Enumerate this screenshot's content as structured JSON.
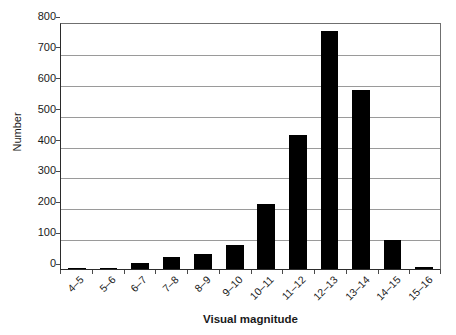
{
  "chart_data": {
    "type": "bar",
    "title": "",
    "xlabel": "Visual magnitude",
    "ylabel": "Number",
    "categories": [
      "4–5",
      "5–6",
      "6–7",
      "7–8",
      "8–9",
      "9–10",
      "10–11",
      "11–12",
      "12–13",
      "13–14",
      "14–15",
      "15–16"
    ],
    "values": [
      3,
      4,
      20,
      38,
      50,
      78,
      210,
      435,
      770,
      580,
      95,
      5
    ],
    "ylim": [
      0,
      800
    ],
    "yticks": [
      0,
      100,
      200,
      300,
      400,
      500,
      600,
      700,
      800
    ],
    "ytick_labels": [
      "0",
      "100",
      "200",
      "300",
      "400",
      "500",
      "600",
      "700",
      "800"
    ],
    "grid": true,
    "legend": false,
    "bar_color": "#000000",
    "grid_color": "#9a9a9a",
    "axis_color": "#2b2b2b",
    "background": "#ffffff"
  }
}
